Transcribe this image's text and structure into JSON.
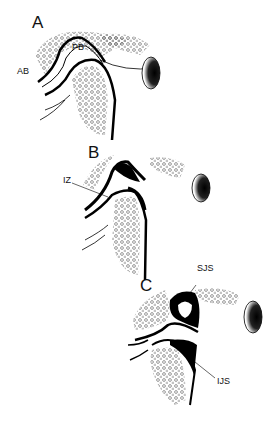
{
  "figure": {
    "panels": [
      {
        "id": "A",
        "label": "A",
        "annotations": [
          {
            "text": "PB"
          },
          {
            "text": "AB"
          }
        ]
      },
      {
        "id": "B",
        "label": "B",
        "annotations": [
          {
            "text": "IZ"
          }
        ]
      },
      {
        "id": "C",
        "label": "C",
        "annotations": [
          {
            "text": "SJS"
          },
          {
            "text": "IJS"
          }
        ]
      }
    ]
  }
}
